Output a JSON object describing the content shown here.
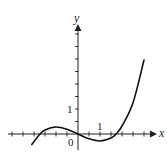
{
  "chart_data": {
    "type": "line",
    "title": "",
    "xlabel": "x",
    "ylabel": "y",
    "tick_labels": {
      "x": [
        "1"
      ],
      "y": [
        "1"
      ],
      "origin": "0"
    },
    "x_range": [
      -3.2,
      3.5
    ],
    "y_range": [
      -0.6,
      4.4
    ],
    "x_tick_step": 0.5,
    "y_tick_step": 0.5,
    "grid": false,
    "legend": null,
    "series": [
      {
        "name": "f(x)",
        "description": "cubic-like curve with local max near x=-1 and local min near x=1, roots near x=-1.7, 0, 1.7",
        "x": [
          -2.1,
          -1.73,
          -1.5,
          -1.0,
          -0.5,
          0.0,
          0.5,
          1.0,
          1.5,
          1.73,
          2.0,
          2.5,
          3.0
        ],
        "y": [
          -0.42,
          0.0,
          0.16,
          0.28,
          0.19,
          0.0,
          -0.19,
          -0.28,
          -0.16,
          0.0,
          0.32,
          1.25,
          2.96
        ]
      }
    ]
  }
}
